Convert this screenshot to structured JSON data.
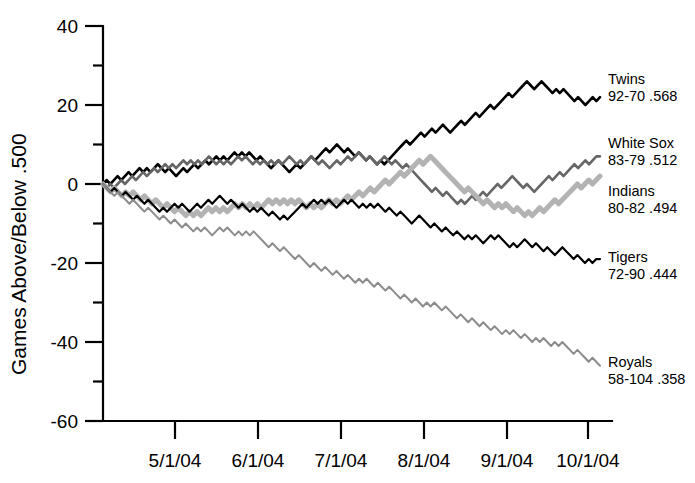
{
  "chart_data": {
    "type": "line",
    "title": "",
    "subtitle": "",
    "xlabel": "",
    "ylabel": "Games Above/Below .500",
    "ylim": [
      -60,
      40
    ],
    "y_ticks": [
      40,
      20,
      0,
      -20,
      -40,
      -60
    ],
    "y_tick_labels": [
      "40",
      "20",
      "0",
      "-20",
      "-40",
      "-60"
    ],
    "y_minor_ticks": [
      30,
      10,
      -10,
      -30,
      -50
    ],
    "x_tick_labels": [
      "5/1/04",
      "6/1/04",
      "7/1/04",
      "8/1/04",
      "9/1/04",
      "10/1/04"
    ],
    "grid": false,
    "legend_position": "right-inline",
    "series": [
      {
        "name": "Twins",
        "record": "92-70 .568",
        "color": "#000000",
        "width": 2.6,
        "final_value": 22,
        "values": [
          0,
          1,
          0,
          1,
          2,
          1,
          2,
          3,
          2,
          3,
          4,
          3,
          4,
          3,
          4,
          5,
          4,
          3,
          4,
          3,
          2,
          3,
          4,
          3,
          4,
          5,
          4,
          5,
          6,
          5,
          6,
          7,
          6,
          7,
          6,
          7,
          8,
          7,
          8,
          7,
          8,
          7,
          6,
          7,
          6,
          5,
          4,
          5,
          6,
          5,
          4,
          3,
          4,
          5,
          4,
          5,
          6,
          7,
          6,
          7,
          8,
          9,
          8,
          9,
          10,
          9,
          8,
          9,
          8,
          7,
          8,
          7,
          6,
          7,
          6,
          5,
          6,
          5,
          6,
          7,
          8,
          9,
          10,
          11,
          10,
          11,
          12,
          13,
          12,
          13,
          14,
          13,
          14,
          15,
          14,
          13,
          14,
          15,
          16,
          15,
          16,
          17,
          18,
          17,
          18,
          19,
          20,
          19,
          20,
          21,
          22,
          23,
          22,
          23,
          24,
          25,
          26,
          25,
          24,
          25,
          26,
          25,
          24,
          23,
          24,
          23,
          24,
          23,
          22,
          21,
          22,
          21,
          20,
          21,
          22,
          21,
          22
        ]
      },
      {
        "name": "White Sox",
        "record": "83-79 .512",
        "color": "#666666",
        "width": 2.6,
        "final_value": 7,
        "values": [
          0,
          -1,
          0,
          -1,
          0,
          1,
          0,
          1,
          2,
          1,
          2,
          3,
          2,
          3,
          4,
          3,
          4,
          5,
          4,
          5,
          4,
          5,
          6,
          5,
          6,
          5,
          6,
          5,
          6,
          7,
          6,
          5,
          6,
          5,
          6,
          5,
          6,
          7,
          6,
          7,
          6,
          5,
          6,
          5,
          6,
          5,
          6,
          5,
          6,
          5,
          6,
          7,
          6,
          5,
          6,
          5,
          6,
          7,
          6,
          5,
          6,
          5,
          4,
          5,
          6,
          5,
          6,
          7,
          6,
          7,
          8,
          7,
          6,
          7,
          6,
          5,
          6,
          7,
          6,
          5,
          6,
          5,
          4,
          5,
          4,
          3,
          2,
          1,
          0,
          -1,
          -2,
          -1,
          -2,
          -3,
          -2,
          -3,
          -4,
          -5,
          -4,
          -5,
          -4,
          -3,
          -4,
          -3,
          -2,
          -3,
          -2,
          -1,
          0,
          -1,
          0,
          1,
          2,
          1,
          0,
          -1,
          0,
          -1,
          -2,
          -1,
          0,
          1,
          2,
          1,
          2,
          3,
          2,
          3,
          4,
          5,
          4,
          5,
          6,
          5,
          6,
          7,
          7
        ]
      },
      {
        "name": "Indians",
        "record": "80-82 .494",
        "color": "#b3b3b3",
        "width": 5.0,
        "final_value": 2,
        "values": [
          0,
          -1,
          -2,
          -1,
          -2,
          -3,
          -2,
          -3,
          -2,
          -3,
          -4,
          -3,
          -4,
          -5,
          -4,
          -5,
          -6,
          -5,
          -6,
          -7,
          -6,
          -7,
          -8,
          -7,
          -8,
          -7,
          -8,
          -7,
          -6,
          -7,
          -6,
          -7,
          -6,
          -7,
          -6,
          -5,
          -6,
          -5,
          -6,
          -5,
          -6,
          -5,
          -6,
          -5,
          -4,
          -5,
          -4,
          -5,
          -4,
          -5,
          -4,
          -5,
          -4,
          -5,
          -6,
          -5,
          -6,
          -5,
          -6,
          -5,
          -4,
          -5,
          -4,
          -5,
          -4,
          -3,
          -4,
          -3,
          -2,
          -3,
          -2,
          -1,
          -2,
          -1,
          0,
          1,
          0,
          1,
          2,
          3,
          2,
          3,
          4,
          5,
          6,
          5,
          6,
          7,
          6,
          5,
          4,
          3,
          2,
          1,
          0,
          -1,
          -2,
          -1,
          -2,
          -3,
          -4,
          -5,
          -4,
          -5,
          -6,
          -5,
          -6,
          -5,
          -6,
          -7,
          -6,
          -7,
          -8,
          -7,
          -8,
          -7,
          -6,
          -7,
          -6,
          -5,
          -4,
          -5,
          -4,
          -3,
          -2,
          -1,
          0,
          -1,
          0,
          1,
          0,
          1,
          2
        ]
      },
      {
        "name": "Tigers",
        "record": "72-90 .444",
        "color": "#000000",
        "width": 2.2,
        "final_value": -19,
        "values": [
          0,
          -1,
          -2,
          -1,
          -2,
          -3,
          -2,
          -3,
          -4,
          -3,
          -4,
          -5,
          -4,
          -5,
          -6,
          -7,
          -6,
          -7,
          -6,
          -5,
          -6,
          -5,
          -6,
          -7,
          -6,
          -5,
          -6,
          -5,
          -4,
          -5,
          -4,
          -3,
          -4,
          -5,
          -4,
          -5,
          -6,
          -5,
          -6,
          -7,
          -6,
          -7,
          -6,
          -7,
          -8,
          -7,
          -8,
          -9,
          -8,
          -9,
          -8,
          -7,
          -6,
          -5,
          -6,
          -5,
          -4,
          -5,
          -4,
          -5,
          -4,
          -5,
          -6,
          -5,
          -4,
          -5,
          -4,
          -5,
          -6,
          -5,
          -6,
          -5,
          -6,
          -5,
          -6,
          -7,
          -6,
          -7,
          -8,
          -7,
          -8,
          -9,
          -10,
          -9,
          -8,
          -9,
          -10,
          -11,
          -10,
          -11,
          -12,
          -11,
          -12,
          -13,
          -12,
          -13,
          -14,
          -13,
          -14,
          -13,
          -14,
          -15,
          -14,
          -13,
          -14,
          -13,
          -14,
          -15,
          -16,
          -15,
          -16,
          -15,
          -14,
          -15,
          -16,
          -15,
          -16,
          -17,
          -16,
          -17,
          -18,
          -17,
          -16,
          -17,
          -18,
          -19,
          -18,
          -19,
          -20,
          -19,
          -20,
          -19,
          -19
        ]
      },
      {
        "name": "Royals",
        "record": "58-104 .358",
        "color": "#8c8c8c",
        "width": 2.0,
        "final_value": -46,
        "values": [
          0,
          -1,
          -2,
          -3,
          -2,
          -3,
          -4,
          -5,
          -4,
          -5,
          -6,
          -7,
          -6,
          -7,
          -8,
          -9,
          -8,
          -9,
          -10,
          -9,
          -10,
          -11,
          -10,
          -11,
          -12,
          -11,
          -12,
          -11,
          -12,
          -13,
          -12,
          -11,
          -12,
          -11,
          -12,
          -13,
          -12,
          -13,
          -12,
          -13,
          -12,
          -13,
          -14,
          -15,
          -16,
          -15,
          -16,
          -17,
          -16,
          -17,
          -18,
          -19,
          -18,
          -19,
          -20,
          -21,
          -20,
          -21,
          -22,
          -21,
          -22,
          -23,
          -22,
          -23,
          -24,
          -23,
          -24,
          -25,
          -24,
          -25,
          -24,
          -25,
          -26,
          -25,
          -26,
          -27,
          -26,
          -27,
          -28,
          -29,
          -28,
          -29,
          -30,
          -29,
          -30,
          -31,
          -30,
          -31,
          -30,
          -31,
          -32,
          -31,
          -32,
          -33,
          -34,
          -33,
          -34,
          -35,
          -34,
          -35,
          -36,
          -35,
          -36,
          -37,
          -36,
          -37,
          -38,
          -37,
          -38,
          -37,
          -38,
          -39,
          -38,
          -39,
          -40,
          -39,
          -40,
          -39,
          -40,
          -41,
          -40,
          -41,
          -40,
          -41,
          -42,
          -43,
          -42,
          -43,
          -44,
          -45,
          -44,
          -45,
          -46
        ]
      }
    ]
  },
  "labels": {
    "twins_name": "Twins",
    "twins_record": "92-70 .568",
    "whitesox_name": "White Sox",
    "whitesox_record": "83-79 .512",
    "indians_name": "Indians",
    "indians_record": "80-82 .494",
    "tigers_name": "Tigers",
    "tigers_record": "72-90 .444",
    "royals_name": "Royals",
    "royals_record": "58-104 .358"
  },
  "axes": {
    "y_title": "Games Above/Below .500",
    "y_40": "40",
    "y_20": "20",
    "y_0": "0",
    "y_n20": "-20",
    "y_n40": "-40",
    "y_n60": "-60",
    "x_may": "5/1/04",
    "x_jun": "6/1/04",
    "x_jul": "7/1/04",
    "x_aug": "8/1/04",
    "x_sep": "9/1/04",
    "x_oct": "10/1/04"
  }
}
